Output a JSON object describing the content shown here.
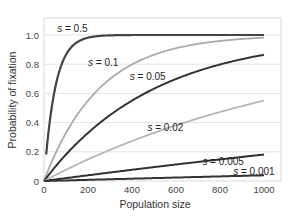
{
  "chart_data": {
    "type": "line",
    "title": "",
    "xlabel": "Population size",
    "ylabel": "Probability of fixation",
    "xlim": [
      0,
      1000
    ],
    "ylim": [
      0,
      1.0
    ],
    "x_ticks": [
      "0",
      "200",
      "400",
      "600",
      "800",
      "1000"
    ],
    "y_ticks": [
      "0",
      "0.2",
      "0.4",
      "0.6",
      "0.8",
      "1.0"
    ],
    "grid": "horizontal",
    "legend": "inline labels",
    "x": [
      10,
      50,
      100,
      150,
      200,
      300,
      400,
      500,
      600,
      700,
      800,
      900,
      1000
    ],
    "series": [
      {
        "name": "s = 0.5",
        "color": "#444444",
        "width": 2.2,
        "values": [
          0.18,
          0.63,
          0.86,
          0.95,
          0.98,
          1.0,
          1.0,
          1.0,
          1.0,
          1.0,
          1.0,
          1.0,
          1.0
        ]
      },
      {
        "name": "s = 0.1",
        "color": "#aaaaaa",
        "width": 1.8,
        "values": [
          0.04,
          0.18,
          0.33,
          0.45,
          0.55,
          0.7,
          0.8,
          0.86,
          0.91,
          0.94,
          0.96,
          0.97,
          0.98
        ]
      },
      {
        "name": "s = 0.05",
        "color": "#333333",
        "width": 2.0,
        "values": [
          0.02,
          0.1,
          0.18,
          0.26,
          0.33,
          0.45,
          0.55,
          0.63,
          0.7,
          0.75,
          0.8,
          0.83,
          0.86
        ]
      },
      {
        "name": "s = 0.02",
        "color": "#b5b5b5",
        "width": 1.8,
        "values": [
          0.01,
          0.04,
          0.08,
          0.11,
          0.15,
          0.21,
          0.27,
          0.33,
          0.38,
          0.43,
          0.47,
          0.51,
          0.55
        ]
      },
      {
        "name": "s = 0.005",
        "color": "#333333",
        "width": 2.0,
        "values": [
          0.0,
          0.01,
          0.02,
          0.03,
          0.04,
          0.06,
          0.08,
          0.1,
          0.11,
          0.13,
          0.15,
          0.16,
          0.18
        ]
      },
      {
        "name": "s = 0.001",
        "color": "#333333",
        "width": 2.0,
        "values": [
          0.0,
          0.0,
          0.004,
          0.006,
          0.008,
          0.012,
          0.016,
          0.02,
          0.024,
          0.028,
          0.032,
          0.035,
          0.04
        ]
      }
    ],
    "annotations": [
      {
        "text": "s = 0.5",
        "x": 60,
        "y": 1.02
      },
      {
        "text": "s = 0.1",
        "x": 200,
        "y": 0.79
      },
      {
        "text": "s = 0.05",
        "x": 390,
        "y": 0.69
      },
      {
        "text": "s = 0.02",
        "x": 470,
        "y": 0.34
      },
      {
        "text": "s = 0.005",
        "x": 720,
        "y": 0.11
      },
      {
        "text": "s = 0.001",
        "x": 860,
        "y": 0.04
      }
    ]
  }
}
